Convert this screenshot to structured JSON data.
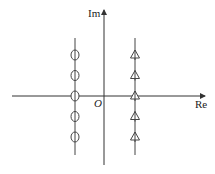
{
  "diagram": {
    "title": "",
    "axes": {
      "x_label": "Re",
      "y_label": "Im",
      "origin_label": "O"
    },
    "lines": [
      {
        "name": "left-line",
        "marker": "circle",
        "count": 5,
        "relation": "left of imaginary axis"
      },
      {
        "name": "right-line",
        "marker": "triangle",
        "count": 5,
        "relation": "right of imaginary axis"
      }
    ],
    "marker_levels": [
      2,
      1,
      0,
      -1,
      -2
    ]
  }
}
